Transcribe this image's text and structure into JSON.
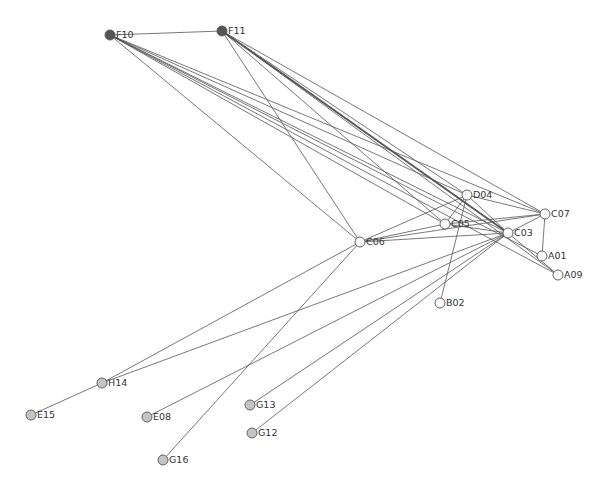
{
  "diagram": {
    "type": "network-graph",
    "node_radius": 5,
    "colors": {
      "background": "#ffffff",
      "edge": "#555555",
      "node_stroke": "#555555",
      "label": "#333333",
      "group_dark": "#555555",
      "group_white": "#fafafa",
      "group_gray": "#c4c4c4"
    },
    "nodes": [
      {
        "id": "F10",
        "label": "F10",
        "x": 110,
        "y": 35,
        "group": "dark"
      },
      {
        "id": "F11",
        "label": "F11",
        "x": 222,
        "y": 31,
        "group": "dark"
      },
      {
        "id": "D04",
        "label": "D04",
        "x": 467,
        "y": 195,
        "group": "white"
      },
      {
        "id": "C07",
        "label": "C07",
        "x": 545,
        "y": 214,
        "group": "white"
      },
      {
        "id": "C05",
        "label": "C05",
        "x": 445,
        "y": 224,
        "group": "white"
      },
      {
        "id": "C03",
        "label": "C03",
        "x": 508,
        "y": 233,
        "group": "white"
      },
      {
        "id": "C06",
        "label": "C06",
        "x": 360,
        "y": 242,
        "group": "white"
      },
      {
        "id": "A01",
        "label": "A01",
        "x": 542,
        "y": 256,
        "group": "white"
      },
      {
        "id": "A09",
        "label": "A09",
        "x": 558,
        "y": 275,
        "group": "white"
      },
      {
        "id": "B02",
        "label": "B02",
        "x": 440,
        "y": 303,
        "group": "white"
      },
      {
        "id": "H14",
        "label": "H14",
        "x": 102,
        "y": 383,
        "group": "gray"
      },
      {
        "id": "E15",
        "label": "E15",
        "x": 31,
        "y": 415,
        "group": "gray"
      },
      {
        "id": "E08",
        "label": "E08",
        "x": 147,
        "y": 417,
        "group": "gray"
      },
      {
        "id": "G13",
        "label": "G13",
        "x": 250,
        "y": 405,
        "group": "gray"
      },
      {
        "id": "G12",
        "label": "G12",
        "x": 252,
        "y": 433,
        "group": "gray"
      },
      {
        "id": "G16",
        "label": "G16",
        "x": 163,
        "y": 460,
        "group": "gray"
      }
    ],
    "edges": [
      {
        "source": "F10",
        "target": "F11"
      },
      {
        "source": "F10",
        "target": "C06"
      },
      {
        "source": "F10",
        "target": "D04"
      },
      {
        "source": "F10",
        "target": "C05"
      },
      {
        "source": "F10",
        "target": "C03"
      },
      {
        "source": "F10",
        "target": "C07"
      },
      {
        "source": "F10",
        "target": "A01"
      },
      {
        "source": "F10",
        "target": "A09"
      },
      {
        "source": "F11",
        "target": "C06"
      },
      {
        "source": "F11",
        "target": "C05"
      },
      {
        "source": "F11",
        "target": "D04"
      },
      {
        "source": "F11",
        "target": "C03",
        "weight": 2
      },
      {
        "source": "F11",
        "target": "C07"
      },
      {
        "source": "F11",
        "target": "A09"
      },
      {
        "source": "D04",
        "target": "C07"
      },
      {
        "source": "D04",
        "target": "C06"
      },
      {
        "source": "D04",
        "target": "C03"
      },
      {
        "source": "D04",
        "target": "B02"
      },
      {
        "source": "D04",
        "target": "C05"
      },
      {
        "source": "C05",
        "target": "C07"
      },
      {
        "source": "C05",
        "target": "C03"
      },
      {
        "source": "C05",
        "target": "C06"
      },
      {
        "source": "C06",
        "target": "C03"
      },
      {
        "source": "C06",
        "target": "C07"
      },
      {
        "source": "C06",
        "target": "H14"
      },
      {
        "source": "C06",
        "target": "G16"
      },
      {
        "source": "C03",
        "target": "C07"
      },
      {
        "source": "C03",
        "target": "A09"
      },
      {
        "source": "C03",
        "target": "H14"
      },
      {
        "source": "C03",
        "target": "E08"
      },
      {
        "source": "C03",
        "target": "G13"
      },
      {
        "source": "C03",
        "target": "G12"
      },
      {
        "source": "C07",
        "target": "A01"
      },
      {
        "source": "H14",
        "target": "E15"
      }
    ]
  }
}
